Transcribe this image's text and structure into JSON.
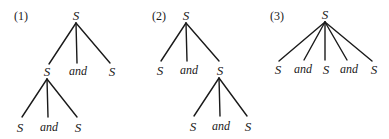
{
  "diagram": {
    "type": "parse-trees",
    "trees": [
      {
        "label": "(1)",
        "root": "S",
        "children": [
          {
            "node": "S",
            "children": [
              "S",
              "and",
              "S"
            ]
          },
          {
            "node": "and"
          },
          {
            "node": "S"
          }
        ]
      },
      {
        "label": "(2)",
        "root": "S",
        "children": [
          {
            "node": "S"
          },
          {
            "node": "and"
          },
          {
            "node": "S",
            "children": [
              "S",
              "and",
              "S"
            ]
          }
        ]
      },
      {
        "label": "(3)",
        "root": "S",
        "children": [
          {
            "node": "S"
          },
          {
            "node": "and"
          },
          {
            "node": "S"
          },
          {
            "node": "and"
          },
          {
            "node": "S"
          }
        ]
      }
    ]
  },
  "t1": {
    "label": "(1)",
    "root": "S",
    "c1": "S",
    "c2": "and",
    "c3": "S",
    "g1": "S",
    "g2": "and",
    "g3": "S"
  },
  "t2": {
    "label": "(2)",
    "root": "S",
    "c1": "S",
    "c2": "and",
    "c3": "S",
    "g1": "S",
    "g2": "and",
    "g3": "S"
  },
  "t3": {
    "label": "(3)",
    "root": "S",
    "c1": "S",
    "c2": "and",
    "c3": "S",
    "c4": "and",
    "c5": "S"
  }
}
